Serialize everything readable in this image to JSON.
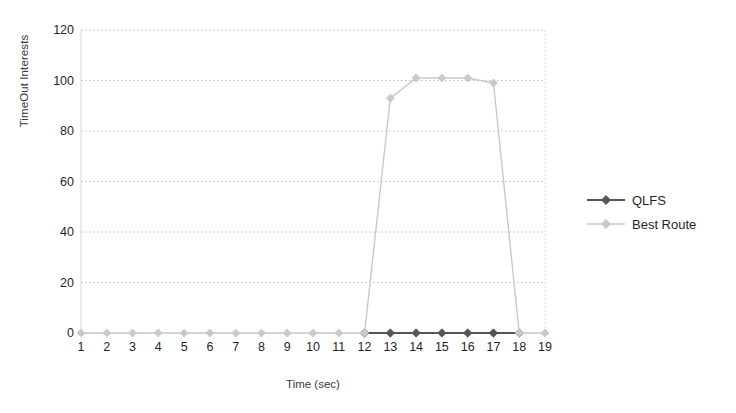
{
  "chart_data": {
    "type": "line",
    "title": "",
    "xlabel": "Time (sec)",
    "ylabel": "TimeOut Interests",
    "x": [
      1,
      2,
      3,
      4,
      5,
      6,
      7,
      8,
      9,
      10,
      11,
      12,
      13,
      14,
      15,
      16,
      17,
      18,
      19
    ],
    "xlim": [
      1,
      19
    ],
    "ylim": [
      0,
      120
    ],
    "xticks": [
      "1",
      "2",
      "3",
      "4",
      "5",
      "6",
      "7",
      "8",
      "9",
      "10",
      "11",
      "12",
      "13",
      "14",
      "15",
      "16",
      "17",
      "18",
      "19"
    ],
    "yticks": [
      "0",
      "20",
      "40",
      "60",
      "80",
      "100",
      "120"
    ],
    "ytick_values": [
      0,
      20,
      40,
      60,
      80,
      100,
      120
    ],
    "grid": "horizontal-dotted",
    "legend_position": "right",
    "series": [
      {
        "name": "QLFS",
        "color": "#555555",
        "marker": "diamond",
        "x": [
          12,
          13,
          14,
          15,
          16,
          17,
          18
        ],
        "values": [
          0,
          0,
          0,
          0,
          0,
          0,
          0
        ]
      },
      {
        "name": "Best Route",
        "color": "#c9c9c9",
        "marker": "diamond",
        "x": [
          1,
          2,
          3,
          4,
          5,
          6,
          7,
          8,
          9,
          10,
          11,
          12,
          13,
          14,
          15,
          16,
          17,
          18,
          19
        ],
        "values": [
          0,
          0,
          0,
          0,
          0,
          0,
          0,
          0,
          0,
          0,
          0,
          0,
          93,
          101,
          101,
          101,
          99,
          0,
          0
        ]
      }
    ]
  },
  "legend": {
    "items": [
      {
        "label": "QLFS"
      },
      {
        "label": "Best Route"
      }
    ]
  },
  "colors": {
    "qlfs": "#555555",
    "best_route": "#c9c9c9",
    "grid": "#c0c0c0",
    "axis": "#d0d0d0",
    "text": "#1f1f1f"
  }
}
